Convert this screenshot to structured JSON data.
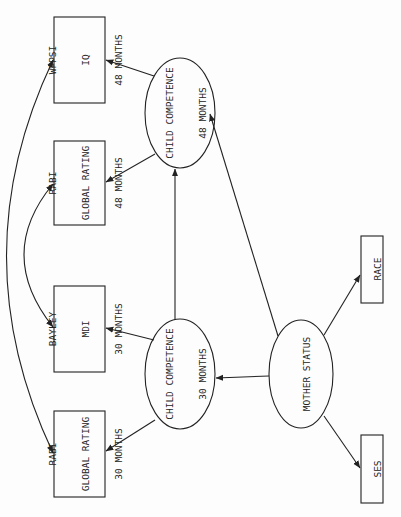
{
  "diagram": {
    "type": "path-diagram",
    "orientation": "rotated-90-ccw",
    "colors": {
      "line": "#222222",
      "background": "#fdfdfd"
    },
    "nodes": {
      "wppsi": {
        "shape": "rect",
        "lines": [
          "WPPSI",
          "IQ",
          "48 MONTHS"
        ]
      },
      "rabi48": {
        "shape": "rect",
        "lines": [
          "RABI",
          "GLOBAL RATING",
          "48 MONTHS"
        ]
      },
      "bayley": {
        "shape": "rect",
        "lines": [
          "BAYLEY",
          "MDI",
          "30 MONTHS"
        ]
      },
      "rabi30": {
        "shape": "rect",
        "lines": [
          "RABI",
          "GLOBAL RATING",
          "30 MONTHS"
        ]
      },
      "cc48": {
        "shape": "ellipse",
        "lines": [
          "CHILD COMPETENCE",
          "48 MONTHS"
        ]
      },
      "cc30": {
        "shape": "ellipse",
        "lines": [
          "CHILD COMPETENCE",
          "30 MONTHS"
        ]
      },
      "mother": {
        "shape": "ellipse",
        "lines": [
          "MOTHER STATUS"
        ]
      },
      "race": {
        "shape": "rect",
        "lines": [
          "RACE"
        ]
      },
      "ses": {
        "shape": "rect",
        "lines": [
          "SES"
        ]
      }
    },
    "edges": [
      {
        "from": "cc48",
        "to": "wppsi",
        "type": "directed"
      },
      {
        "from": "cc48",
        "to": "rabi48",
        "type": "directed"
      },
      {
        "from": "cc30",
        "to": "bayley",
        "type": "directed"
      },
      {
        "from": "cc30",
        "to": "rabi30",
        "type": "directed"
      },
      {
        "from": "cc30",
        "to": "cc48",
        "type": "directed"
      },
      {
        "from": "mother",
        "to": "cc30",
        "type": "directed"
      },
      {
        "from": "mother",
        "to": "cc48",
        "type": "directed"
      },
      {
        "from": "mother",
        "to": "race",
        "type": "directed"
      },
      {
        "from": "mother",
        "to": "ses",
        "type": "directed"
      },
      {
        "from": "rabi48",
        "to": "bayley",
        "type": "bidirected-curve"
      },
      {
        "from": "wppsi",
        "to": "rabi30",
        "type": "bidirected-curve"
      }
    ]
  }
}
